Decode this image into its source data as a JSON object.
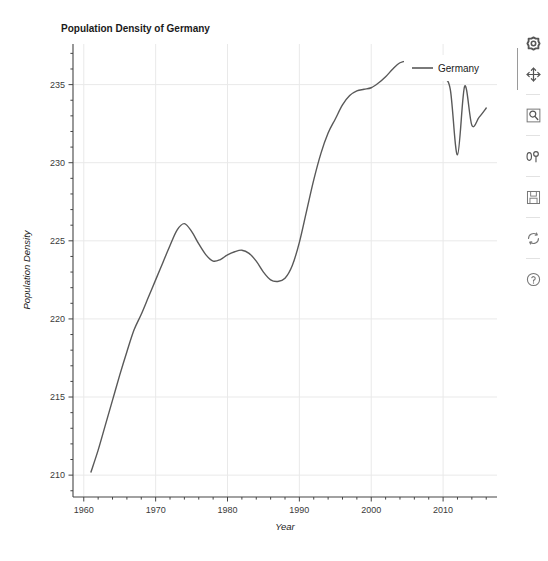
{
  "figure": {
    "background": "#ffffff",
    "plot_background": "#ffffff"
  },
  "chart_data": {
    "type": "line",
    "title": "Population Density of Germany",
    "xlabel": "Year",
    "ylabel": "Population Density",
    "xlim": [
      1958.5,
      2017.5
    ],
    "ylim": [
      208.6,
      237.6
    ],
    "xticks": [
      1960,
      1970,
      1980,
      1990,
      2000,
      2010
    ],
    "xtick_labels": [
      "1960",
      "1970",
      "1980",
      "1990",
      "2000",
      "2010"
    ],
    "yticks": [
      210,
      215,
      220,
      225,
      230,
      235
    ],
    "ytick_labels": [
      "210",
      "215",
      "220",
      "225",
      "230",
      "235"
    ],
    "xminor_step": 2,
    "yminor_step": 1,
    "grid": true,
    "grid_color": "#e9e9e9",
    "legend": {
      "position": "upper right",
      "entries": [
        {
          "label": "Germany",
          "color": "#595959"
        }
      ]
    },
    "series": [
      {
        "name": "Germany",
        "color": "#595959",
        "linewidth": 1.4,
        "x": [
          1961,
          1962,
          1963,
          1964,
          1965,
          1966,
          1967,
          1968,
          1969,
          1970,
          1971,
          1972,
          1973,
          1974,
          1975,
          1976,
          1977,
          1978,
          1979,
          1980,
          1981,
          1982,
          1983,
          1984,
          1985,
          1986,
          1987,
          1988,
          1989,
          1990,
          1991,
          1992,
          1993,
          1994,
          1995,
          1996,
          1997,
          1998,
          1999,
          2000,
          2001,
          2002,
          2003,
          2004,
          2005,
          2006,
          2007,
          2008,
          2009,
          2010,
          2011,
          2012,
          2013,
          2014,
          2015,
          2016
        ],
        "y": [
          210.2,
          211.6,
          213.2,
          214.8,
          216.4,
          217.9,
          219.3,
          220.3,
          221.4,
          222.5,
          223.6,
          224.7,
          225.7,
          226.1,
          225.6,
          224.8,
          224.1,
          223.7,
          223.8,
          224.1,
          224.3,
          224.4,
          224.2,
          223.7,
          223.0,
          222.5,
          222.4,
          222.6,
          223.4,
          224.9,
          226.9,
          228.9,
          230.6,
          231.9,
          232.8,
          233.7,
          234.3,
          234.6,
          234.7,
          234.8,
          235.1,
          235.5,
          236.0,
          236.4,
          236.5,
          236.4,
          236.2,
          236.0,
          235.7,
          235.4,
          234.7,
          230.5,
          234.9,
          232.4,
          232.9,
          233.5
        ]
      }
    ],
    "annotations": []
  },
  "toolbar": {
    "items": [
      {
        "name": "home-reset-button",
        "label": "Reset original view",
        "icon": "home-icon"
      },
      {
        "name": "pan-button",
        "label": "Pan axes with left mouse, zoom with right",
        "icon": "move-icon"
      },
      {
        "name": "zoom-button",
        "label": "Zoom to rectangle",
        "icon": "magnifier-icon"
      },
      {
        "name": "configure-subplots-button",
        "label": "Configure subplots",
        "icon": "sliders-icon"
      },
      {
        "name": "save-button",
        "label": "Save the figure",
        "icon": "floppy-disk-icon"
      },
      {
        "name": "refresh-button",
        "label": "Refresh",
        "icon": "refresh-icon"
      },
      {
        "name": "help-button",
        "label": "Help",
        "icon": "question-mark-icon"
      }
    ]
  }
}
